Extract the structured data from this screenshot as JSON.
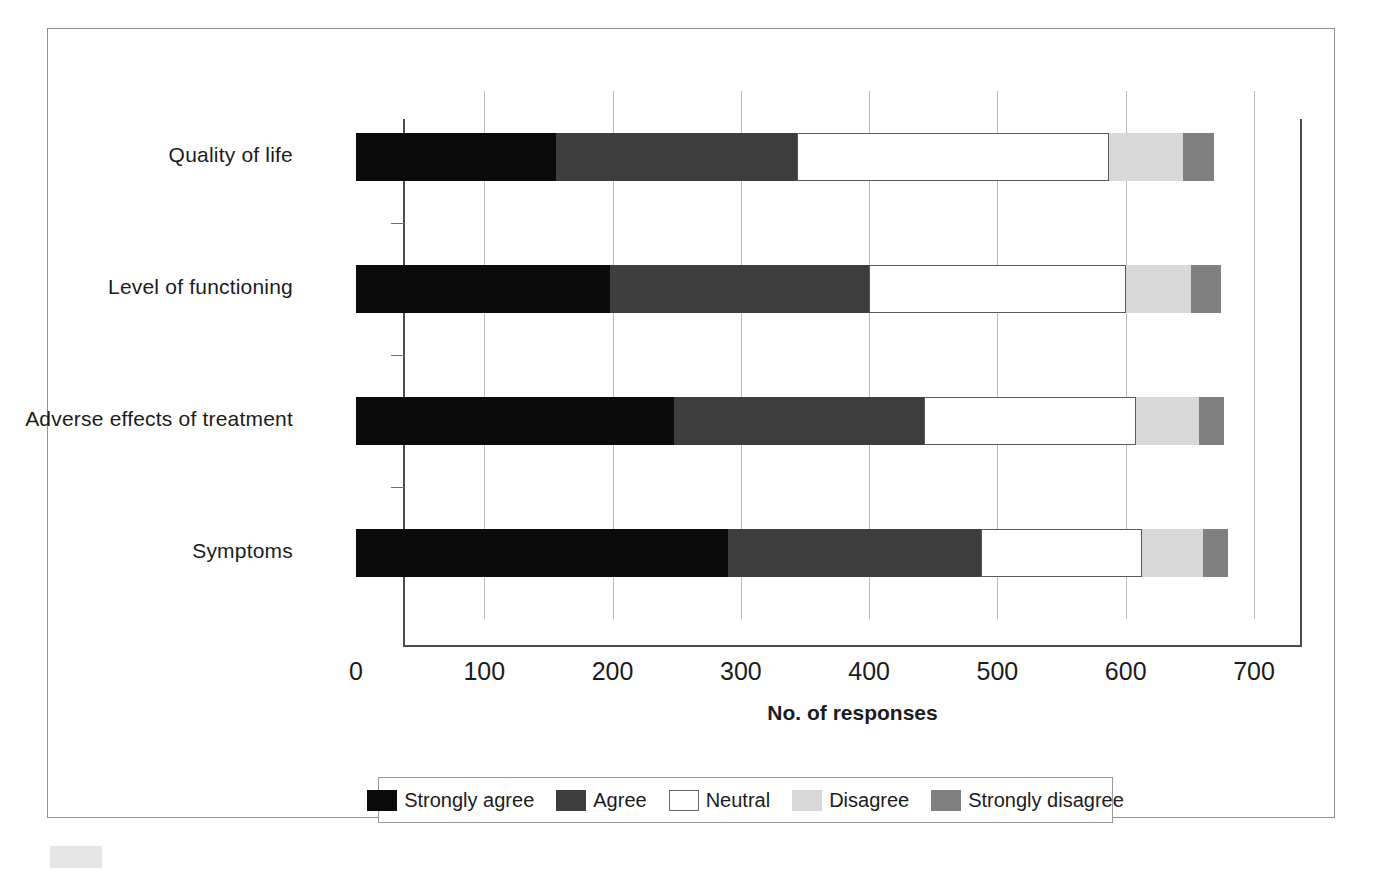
{
  "chart_data": {
    "type": "bar",
    "orientation": "horizontal",
    "stacked": true,
    "title": "",
    "xlabel": "No. of responses",
    "ylabel": "",
    "xlim": [
      0,
      700
    ],
    "xticks": [
      "0",
      "100",
      "200",
      "300",
      "400",
      "500",
      "600",
      "700"
    ],
    "xtick_values": [
      0,
      100,
      200,
      300,
      400,
      500,
      600,
      700
    ],
    "grid": "vertical",
    "legend_position": "bottom",
    "categories": [
      "Quality of life",
      "Level of functioning",
      "Adverse effects of treatment",
      "Symptoms"
    ],
    "series": [
      {
        "name": "Strongly agree",
        "color": "#0b0b0b",
        "values": [
          156,
          198,
          248,
          290
        ]
      },
      {
        "name": "Agree",
        "color": "#3d3d3d",
        "values": [
          188,
          202,
          195,
          197
        ]
      },
      {
        "name": "Neutral",
        "color": "#ffffff",
        "values": [
          243,
          200,
          165,
          126
        ]
      },
      {
        "name": "Disagree",
        "color": "#d8d8d8",
        "values": [
          58,
          51,
          49,
          47
        ]
      },
      {
        "name": "Strongly disagree",
        "color": "#808080",
        "values": [
          24,
          23,
          20,
          20
        ]
      }
    ]
  },
  "axis": {
    "x_title": "No. of responses"
  },
  "legend": {
    "items": [
      {
        "label": "Strongly agree",
        "key": "sa"
      },
      {
        "label": "Agree",
        "key": "a"
      },
      {
        "label": "Neutral",
        "key": "n"
      },
      {
        "label": "Disagree",
        "key": "d"
      },
      {
        "label": "Strongly disagree",
        "key": "sd"
      }
    ]
  },
  "colors": {
    "strongly_agree": "#0b0b0b",
    "agree": "#3d3d3d",
    "neutral": "#ffffff",
    "disagree": "#d8d8d8",
    "strongly_disagree": "#808080",
    "gridline": "#b9b9b9",
    "axis": "#4d4d4d",
    "frame": "#8f8f8f"
  }
}
